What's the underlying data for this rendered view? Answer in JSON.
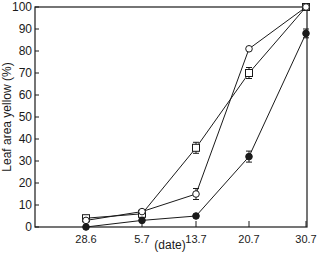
{
  "chart_data": {
    "type": "line",
    "title": "",
    "xlabel": "(date)",
    "ylabel": "Leaf area yellow (%)",
    "categories": [
      "28.6",
      "5.7",
      "13.7",
      "20.7",
      "30.7"
    ],
    "ylim": [
      0,
      100
    ],
    "yticks": [
      0,
      10,
      20,
      30,
      40,
      50,
      60,
      70,
      80,
      90,
      100
    ],
    "grid": false,
    "legend": "none",
    "series": [
      {
        "name": "open squares",
        "marker": "square-open",
        "values": [
          4,
          6,
          36,
          70,
          100
        ],
        "errors": [
          0,
          0,
          2.5,
          2.5,
          0
        ]
      },
      {
        "name": "open circles",
        "marker": "circle-open",
        "values": [
          3,
          7,
          15,
          81,
          100
        ],
        "errors": [
          0,
          0,
          2.5,
          0,
          0
        ]
      },
      {
        "name": "filled circles",
        "marker": "circle-filled",
        "values": [
          0,
          3,
          5,
          32,
          88
        ],
        "errors": [
          0,
          0,
          0,
          2.5,
          2
        ]
      }
    ]
  },
  "colors": {
    "ink": "#1a1a1a",
    "background": "#ffffff"
  }
}
